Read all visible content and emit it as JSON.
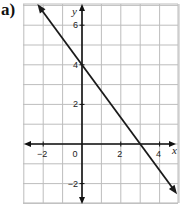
{
  "panel_label": "a)",
  "chart_data": {
    "type": "line",
    "title": "",
    "xlabel": "x",
    "ylabel": "y",
    "xlim": [
      -3,
      4.8
    ],
    "ylim": [
      -3,
      7
    ],
    "grid": true,
    "grid_step": 1,
    "x_ticks": [
      -2,
      0,
      2,
      4
    ],
    "x_tick_labels": [
      "−2",
      "0",
      "2",
      "4"
    ],
    "y_ticks": [
      6,
      4,
      2,
      -2
    ],
    "y_tick_labels": [
      "6",
      "4",
      "2",
      "−2"
    ],
    "series": [
      {
        "name": "line",
        "equation": "y = -4/3 x + 4",
        "points": [
          {
            "x": 0,
            "y": 4
          },
          {
            "x": 3,
            "y": 0
          }
        ],
        "x_range": [
          -2.3,
          4.9
        ],
        "arrows": "both",
        "color": "#1a1a1a"
      }
    ],
    "colors": {
      "grid": "#bdbdbd",
      "axis": "#111111",
      "line": "#1a1a1a"
    }
  }
}
